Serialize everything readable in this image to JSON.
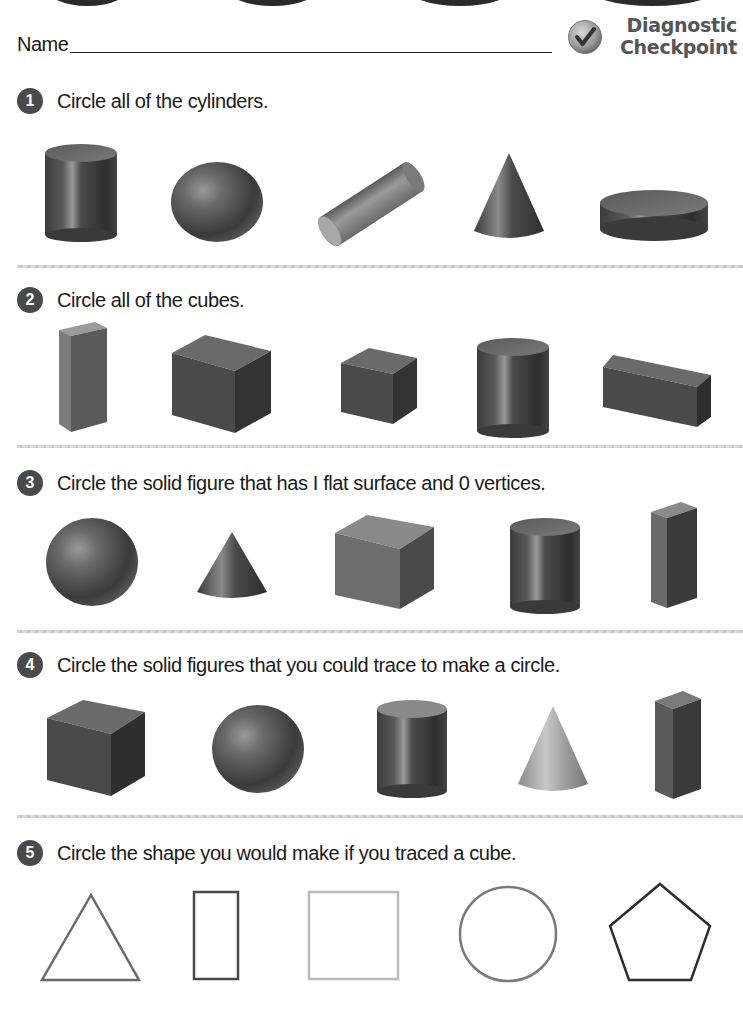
{
  "header": {
    "name_label": "Name",
    "badge_title_line1": "Diagnostic",
    "badge_title_line2": "Checkpoint",
    "badge_icon": "checkmark-circle-icon"
  },
  "questions": [
    {
      "number": "1",
      "text": "Circle all of the cylinders.",
      "figures": [
        "cylinder",
        "sphere",
        "cylinder-tilted",
        "cone",
        "cylinder-short"
      ]
    },
    {
      "number": "2",
      "text": "Circle all of the cubes.",
      "figures": [
        "rectangular-prism-tall",
        "cube",
        "cube-small",
        "cylinder",
        "rectangular-prism-wide"
      ]
    },
    {
      "number": "3",
      "text": "Circle the solid figure that has  I  flat surface and 0 vertices.",
      "figures": [
        "sphere",
        "cone",
        "cube",
        "cylinder",
        "rectangular-prism-tall"
      ]
    },
    {
      "number": "4",
      "text": "Circle the solid figures that you could trace to make a circle.",
      "figures": [
        "cube",
        "sphere",
        "cylinder",
        "cone",
        "rectangular-prism-tall"
      ]
    },
    {
      "number": "5",
      "text": "Circle the shape you would make if you traced a cube.",
      "figures": [
        "triangle",
        "rectangle",
        "square",
        "circle",
        "pentagon"
      ]
    }
  ],
  "colors": {
    "badge_number_bg": "#4a4a4a",
    "title_gray": "#555555",
    "solid_dark": "#3a3a3a",
    "solid_mid": "#6a6a6a",
    "divider": "#cccccc"
  }
}
